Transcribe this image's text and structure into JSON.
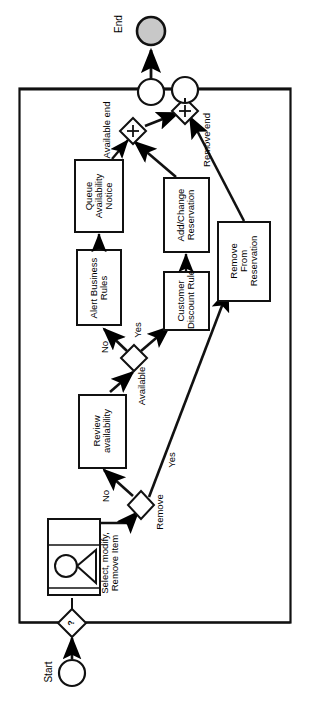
{
  "diagram": {
    "type": "bpmn-process-flow",
    "orientation": "rotated-90-ccw",
    "title_visible": false,
    "colors": {
      "stroke": "#000000",
      "fill": "#ffffff",
      "end_event_fill": "#c8c8c8",
      "background": "#ffffff"
    },
    "start_event": {
      "label": "Start",
      "shape": "circle-thin"
    },
    "end_event": {
      "label": "End",
      "shape": "circle-filled-gray"
    },
    "gateways": [
      {
        "id": "gw-start-question",
        "marker": "?",
        "label": ""
      },
      {
        "id": "gw-remove",
        "marker": "",
        "label": "Remove"
      },
      {
        "id": "gw-available",
        "marker": "",
        "label": "Available"
      },
      {
        "id": "gw-join-available",
        "marker": "+",
        "label": "Available end"
      },
      {
        "id": "gw-join-remove",
        "marker": "+",
        "label": "Remove end"
      }
    ],
    "tasks": [
      {
        "id": "task-select-modify",
        "label": "Select, modify,\nRemove Item",
        "kind": "user-task"
      },
      {
        "id": "task-review-availability",
        "label": "Review\navailability",
        "kind": "task"
      },
      {
        "id": "task-alert-business-rules",
        "label": "Alert Business\nRules",
        "kind": "task"
      },
      {
        "id": "task-queue-availability-notice",
        "label": "Queue\nAvailability\nNotice",
        "kind": "task"
      },
      {
        "id": "task-customer-discount-rule",
        "label": "Customer\nDiscount Rule",
        "kind": "task"
      },
      {
        "id": "task-add-change-reservation",
        "label": "Add/Change\nReservation",
        "kind": "task"
      },
      {
        "id": "task-remove-from-reservation",
        "label": "Remove\nFrom\nReservation",
        "kind": "task"
      }
    ],
    "flow_labels": [
      {
        "id": "flow-remove-yes",
        "text": "Yes"
      },
      {
        "id": "flow-available-no",
        "text": "No"
      },
      {
        "id": "flow-availability-no",
        "text": "No"
      },
      {
        "id": "flow-availability-yes",
        "text": "Yes"
      }
    ],
    "container": {
      "label": ""
    }
  }
}
